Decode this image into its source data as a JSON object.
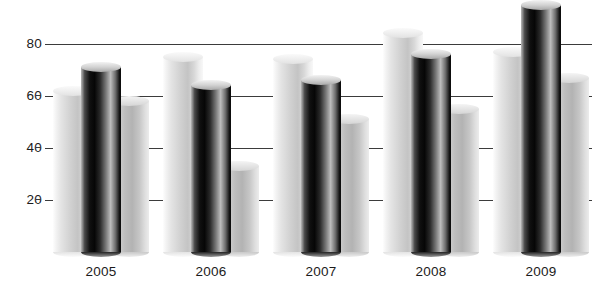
{
  "chart_data": {
    "type": "bar",
    "title": "",
    "subtitle": "",
    "xlabel": "",
    "ylabel": "",
    "categories": [
      "2005",
      "2006",
      "2007",
      "2008",
      "2009"
    ],
    "yticks": [
      20,
      40,
      60,
      80
    ],
    "ylim": [
      0,
      100
    ],
    "grid": true,
    "legend": "none",
    "style": "3d-cylinder",
    "series": [
      {
        "name": "series-1",
        "color": "#d2d2d2",
        "values": [
          64,
          77,
          76,
          86,
          79
        ]
      },
      {
        "name": "series-2",
        "color": "#101010",
        "values": [
          73,
          66,
          68,
          78,
          97
        ]
      },
      {
        "name": "series-3",
        "color": "#bdbdbd",
        "values": [
          60,
          35,
          53,
          57,
          69
        ]
      }
    ]
  },
  "axis": {
    "y": {
      "ticks": [
        {
          "label": "80",
          "value": 80
        },
        {
          "label": "60",
          "value": 60
        },
        {
          "label": "40",
          "value": 40
        },
        {
          "label": "20",
          "value": 20
        }
      ]
    },
    "x": {
      "ticks": [
        {
          "label": "2005"
        },
        {
          "label": "2006"
        },
        {
          "label": "2007"
        },
        {
          "label": "2008"
        },
        {
          "label": "2009"
        }
      ]
    }
  }
}
